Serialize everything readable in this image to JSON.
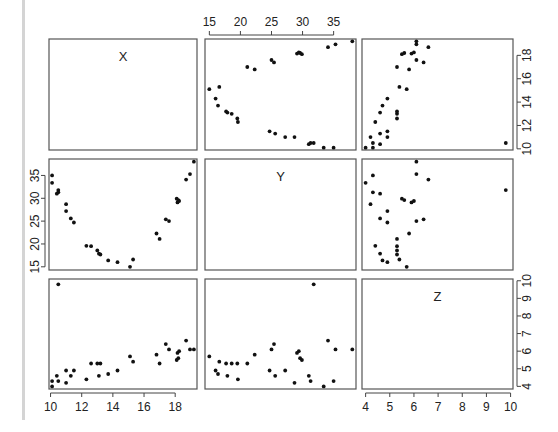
{
  "chart_data": {
    "type": "scatter",
    "title": "",
    "subtitle": "scatterplot matrix (pairs plot)",
    "variables": [
      "X",
      "Y",
      "Z"
    ],
    "grid": false,
    "legend": null,
    "axes": {
      "X": {
        "range": [
          9.9,
          19.4
        ],
        "ticks": [
          10,
          12,
          14,
          16,
          18
        ]
      },
      "Y": {
        "range": [
          14.3,
          38.6
        ],
        "ticks": [
          15,
          20,
          25,
          30,
          35
        ]
      },
      "Z": {
        "range": [
          3.85,
          10.1
        ],
        "ticks": [
          4,
          5,
          6,
          7,
          8,
          9,
          10
        ]
      }
    },
    "points": [
      {
        "x": 10.1,
        "y": 35.0,
        "z": 4.3
      },
      {
        "x": 10.1,
        "y": 33.4,
        "z": 4.0
      },
      {
        "x": 10.5,
        "y": 31.8,
        "z": 9.8
      },
      {
        "x": 10.5,
        "y": 31.3,
        "z": 4.3
      },
      {
        "x": 10.4,
        "y": 31.0,
        "z": 4.6
      },
      {
        "x": 11.0,
        "y": 28.7,
        "z": 4.2
      },
      {
        "x": 11.0,
        "y": 27.2,
        "z": 4.9
      },
      {
        "x": 11.3,
        "y": 25.6,
        "z": 4.6
      },
      {
        "x": 11.5,
        "y": 24.7,
        "z": 4.9
      },
      {
        "x": 12.3,
        "y": 19.6,
        "z": 4.4
      },
      {
        "x": 12.6,
        "y": 19.5,
        "z": 5.3
      },
      {
        "x": 13.0,
        "y": 18.6,
        "z": 5.3
      },
      {
        "x": 13.1,
        "y": 17.9,
        "z": 4.6
      },
      {
        "x": 13.2,
        "y": 17.7,
        "z": 5.3
      },
      {
        "x": 13.7,
        "y": 16.4,
        "z": 4.7
      },
      {
        "x": 14.3,
        "y": 16.0,
        "z": 4.9
      },
      {
        "x": 15.1,
        "y": 15.0,
        "z": 5.7
      },
      {
        "x": 15.3,
        "y": 16.6,
        "z": 5.4
      },
      {
        "x": 16.8,
        "y": 22.3,
        "z": 5.8
      },
      {
        "x": 17.0,
        "y": 21.1,
        "z": 5.3
      },
      {
        "x": 17.4,
        "y": 25.4,
        "z": 6.4
      },
      {
        "x": 17.6,
        "y": 25.0,
        "z": 6.1
      },
      {
        "x": 18.1,
        "y": 29.9,
        "z": 5.5
      },
      {
        "x": 18.15,
        "y": 29.1,
        "z": 5.9
      },
      {
        "x": 18.2,
        "y": 29.6,
        "z": 5.6
      },
      {
        "x": 18.25,
        "y": 29.4,
        "z": 6.0
      },
      {
        "x": 18.7,
        "y": 34.1,
        "z": 6.6
      },
      {
        "x": 18.95,
        "y": 35.3,
        "z": 6.1
      },
      {
        "x": 19.2,
        "y": 38.0,
        "z": 6.1
      }
    ],
    "panels": [
      {
        "row": 0,
        "col": 0,
        "kind": "label",
        "label": "X"
      },
      {
        "row": 0,
        "col": 1,
        "kind": "scatter",
        "xvar": "Y",
        "yvar": "X"
      },
      {
        "row": 0,
        "col": 2,
        "kind": "scatter",
        "xvar": "Z",
        "yvar": "X"
      },
      {
        "row": 1,
        "col": 0,
        "kind": "scatter",
        "xvar": "X",
        "yvar": "Y"
      },
      {
        "row": 1,
        "col": 1,
        "kind": "label",
        "label": "Y"
      },
      {
        "row": 1,
        "col": 2,
        "kind": "scatter",
        "xvar": "Z",
        "yvar": "Y"
      },
      {
        "row": 2,
        "col": 0,
        "kind": "scatter",
        "xvar": "X",
        "yvar": "Z"
      },
      {
        "row": 2,
        "col": 1,
        "kind": "scatter",
        "xvar": "Y",
        "yvar": "Z"
      },
      {
        "row": 2,
        "col": 2,
        "kind": "label",
        "label": "Z"
      }
    ],
    "axis_placement": {
      "top": {
        "col": 1,
        "var": "Y"
      },
      "right_row0": {
        "row": 0,
        "var": "X"
      },
      "left_row1": {
        "row": 1,
        "var": "Y"
      },
      "bottom_col0": {
        "col": 0,
        "var": "X"
      },
      "bottom_col2": {
        "col": 2,
        "var": "Z"
      },
      "right_row2": {
        "row": 2,
        "var": "Z"
      }
    }
  },
  "layout": {
    "cols": [
      [
        49,
        197
      ],
      [
        205,
        356
      ],
      [
        362,
        513
      ]
    ],
    "rows": [
      [
        39,
        150
      ],
      [
        159,
        270
      ],
      [
        279,
        389
      ]
    ]
  }
}
